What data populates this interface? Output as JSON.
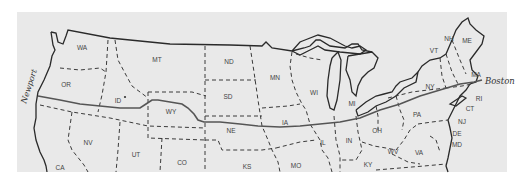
{
  "map": {
    "title": "Route across the United States",
    "background": "#e9e9e9",
    "line_color": "#2a2a2a",
    "route_color": "#555555",
    "endpoints": [
      {
        "label": "Newport",
        "x": 16,
        "y": 82
      },
      {
        "label": "Boston",
        "x": 494,
        "y": 81
      }
    ],
    "states": [
      {
        "abbr": "WA",
        "x": 82,
        "y": 50
      },
      {
        "abbr": "OR",
        "x": 66,
        "y": 87
      },
      {
        "abbr": "ID",
        "x": 118,
        "y": 103
      },
      {
        "abbr": "MT",
        "x": 157,
        "y": 62
      },
      {
        "abbr": "WY",
        "x": 171,
        "y": 114
      },
      {
        "abbr": "NV",
        "x": 88,
        "y": 145
      },
      {
        "abbr": "UT",
        "x": 136,
        "y": 157
      },
      {
        "abbr": "CA",
        "x": 60,
        "y": 170
      },
      {
        "abbr": "CO",
        "x": 182,
        "y": 165
      },
      {
        "abbr": "ND",
        "x": 229,
        "y": 64
      },
      {
        "abbr": "SD",
        "x": 228,
        "y": 99
      },
      {
        "abbr": "NE",
        "x": 231,
        "y": 133
      },
      {
        "abbr": "KS",
        "x": 247,
        "y": 169
      },
      {
        "abbr": "MN",
        "x": 275,
        "y": 80
      },
      {
        "abbr": "IA",
        "x": 285,
        "y": 125
      },
      {
        "abbr": "MO",
        "x": 296,
        "y": 168
      },
      {
        "abbr": "WI",
        "x": 314,
        "y": 95
      },
      {
        "abbr": "MI",
        "x": 352,
        "y": 106
      },
      {
        "abbr": "IL",
        "x": 323,
        "y": 145
      },
      {
        "abbr": "IN",
        "x": 349,
        "y": 143
      },
      {
        "abbr": "OH",
        "x": 377,
        "y": 133
      },
      {
        "abbr": "KY",
        "x": 368,
        "y": 167
      },
      {
        "abbr": "WV",
        "x": 393,
        "y": 154
      },
      {
        "abbr": "VA",
        "x": 419,
        "y": 155
      },
      {
        "abbr": "PA",
        "x": 417,
        "y": 117
      },
      {
        "abbr": "NY",
        "x": 430,
        "y": 89
      },
      {
        "abbr": "VT",
        "x": 434,
        "y": 53
      },
      {
        "abbr": "NH",
        "x": 449,
        "y": 41
      },
      {
        "abbr": "ME",
        "x": 467,
        "y": 43
      },
      {
        "abbr": "MA",
        "x": 476,
        "y": 77
      },
      {
        "abbr": "RI",
        "x": 479,
        "y": 101
      },
      {
        "abbr": "CT",
        "x": 470,
        "y": 111
      },
      {
        "abbr": "NJ",
        "x": 462,
        "y": 124
      },
      {
        "abbr": "DE",
        "x": 457,
        "y": 136
      },
      {
        "abbr": "MD",
        "x": 457,
        "y": 147
      }
    ]
  }
}
